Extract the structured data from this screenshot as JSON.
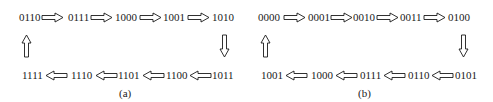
{
  "panels": [
    {
      "label": "(a)",
      "top_row": [
        "0110",
        "0111",
        "1000",
        "1001",
        "1010"
      ],
      "bottom_row": [
        "1111",
        "1110",
        "1101",
        "1100",
        "1011"
      ]
    },
    {
      "label": "(b)",
      "top_row": [
        "0000",
        "0001",
        "0010",
        "0011",
        "0100"
      ],
      "bottom_row": [
        "1001",
        "1000",
        "0111",
        "0110",
        "0101"
      ]
    }
  ],
  "icons": {
    "right": "right-arrow-icon",
    "left": "left-arrow-icon",
    "up": "up-arrow-icon",
    "down": "down-arrow-icon"
  },
  "colors": {
    "stroke": "#1a1a1a",
    "background": "#ffffff"
  }
}
